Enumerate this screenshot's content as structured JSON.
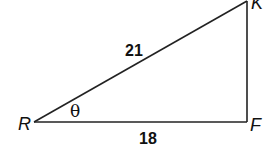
{
  "diagram": {
    "type": "right-triangle",
    "vertices": [
      {
        "name": "R",
        "label": "R",
        "x": 34,
        "y": 122
      },
      {
        "name": "F",
        "label": "F",
        "x": 247,
        "y": 122
      },
      {
        "name": "K",
        "label": "K",
        "x": 247,
        "y": 1
      }
    ],
    "sides": {
      "hypotenuse": {
        "from": "R",
        "to": "K",
        "label": "21"
      },
      "base": {
        "from": "R",
        "to": "F",
        "label": "18"
      }
    },
    "angle": {
      "at": "R",
      "label": "θ"
    },
    "line_color": "#222222"
  }
}
